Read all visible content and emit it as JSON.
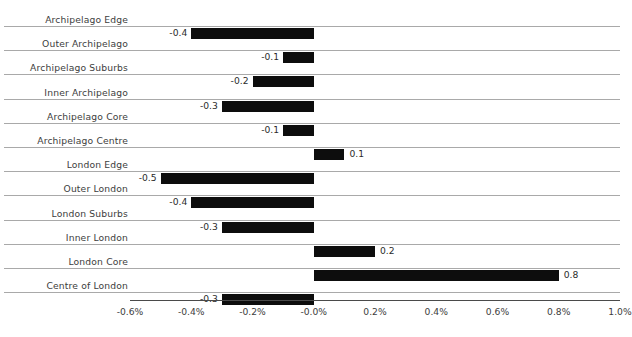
{
  "chart_data": {
    "type": "bar",
    "orientation": "horizontal",
    "title": "",
    "subtitle": "",
    "xlabel": "",
    "ylabel": "",
    "grid": true,
    "legend": null,
    "xlim": [
      -0.6,
      1.0
    ],
    "xtick_step": 0.2,
    "xticks": [
      -0.6,
      -0.4,
      -0.2,
      -0.0,
      0.2,
      0.4,
      0.6,
      0.8,
      1.0
    ],
    "xtick_labels": [
      "-0.6%",
      "-0.4%",
      "-0.2%",
      "-0.0%",
      "0.2%",
      "0.4%",
      "0.6%",
      "0.8%",
      "1.0%"
    ],
    "bar_color": "#0d0d0d",
    "gridline_color": "#a9a9a9",
    "axis_color": "#4a4a4a",
    "categories": [
      "Archipelago Edge",
      "Outer Archipelago",
      "Archipelago Suburbs",
      "Inner Archipelago",
      "Archipelago Core",
      "Archipelago Centre",
      "London Edge",
      "Outer London",
      "London Suburbs",
      "Inner London",
      "London Core",
      "Centre of London"
    ],
    "values": [
      -0.4,
      -0.1,
      -0.2,
      -0.3,
      -0.1,
      0.1,
      -0.5,
      -0.4,
      -0.3,
      0.2,
      0.8,
      -0.3
    ],
    "value_labels": [
      "-0.4",
      "-0.1",
      "-0.2",
      "-0.3",
      "-0.1",
      "0.1",
      "-0.5",
      "-0.4",
      "-0.3",
      "0.2",
      "0.8",
      "-0.3"
    ]
  }
}
